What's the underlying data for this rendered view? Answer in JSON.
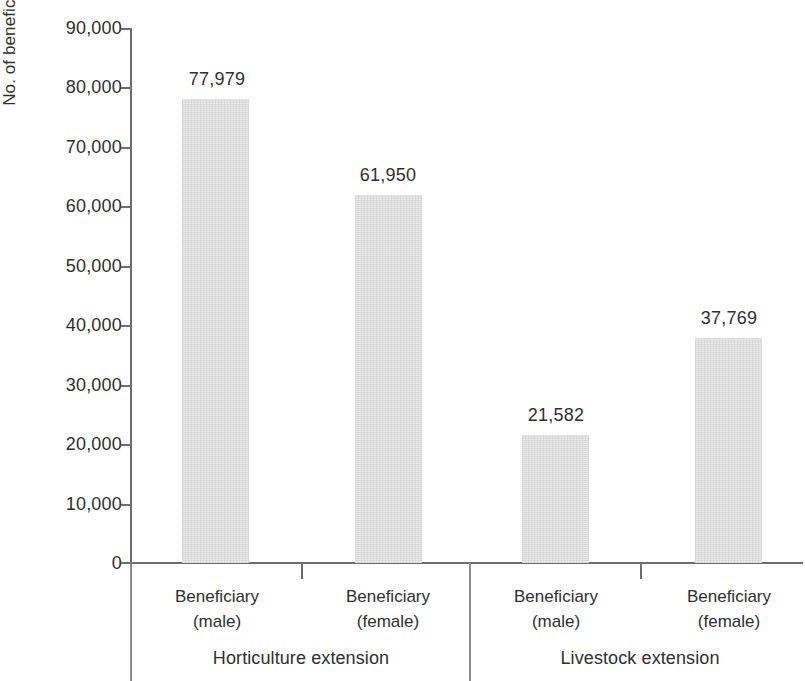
{
  "chart_data": {
    "type": "bar",
    "title": "",
    "subtitle": "",
    "xlabel": "",
    "ylabel": "No. of beneficiaries",
    "ylim": [
      0,
      90000
    ],
    "ytick_values": [
      0,
      10000,
      20000,
      30000,
      40000,
      50000,
      60000,
      70000,
      80000,
      90000
    ],
    "ytick_labels": [
      "0",
      "10,000",
      "20,000",
      "30,000",
      "40,000",
      "50,000",
      "60,000",
      "70,000",
      "80,000",
      "90,000"
    ],
    "grid": false,
    "legend": "none",
    "bar_color": "#ebebeb",
    "axis_color": "#6d6d6d",
    "text_color": "#2f2f2f",
    "categories": [
      "Beneficiary (male)",
      "Beneficiary (female)",
      "Beneficiary (male)",
      "Beneficiary (female)"
    ],
    "values": [
      77979,
      61950,
      21582,
      37769
    ],
    "value_labels": [
      "77,979",
      "61,950",
      "21,582",
      "37,769"
    ],
    "groups": [
      {
        "label": "Horticulture extension",
        "category_indices": [
          0,
          1
        ]
      },
      {
        "label": "Livestock extension",
        "category_indices": [
          2,
          3
        ]
      }
    ]
  },
  "axis": {
    "y_title": "No. of beneficiaries"
  },
  "bars": [
    {
      "line1": "Beneficiary",
      "line2": "(male)",
      "value_label": "77,979"
    },
    {
      "line1": "Beneficiary",
      "line2": "(female)",
      "value_label": "61,950"
    },
    {
      "line1": "Beneficiary",
      "line2": "(male)",
      "value_label": "21,582"
    },
    {
      "line1": "Beneficiary",
      "line2": "(female)",
      "value_label": "37,769"
    }
  ],
  "groups": [
    {
      "label": "Horticulture extension"
    },
    {
      "label": "Livestock extension"
    }
  ],
  "yticks": [
    {
      "label": "90,000"
    },
    {
      "label": "80,000"
    },
    {
      "label": "70,000"
    },
    {
      "label": "60,000"
    },
    {
      "label": "50,000"
    },
    {
      "label": "40,000"
    },
    {
      "label": "30,000"
    },
    {
      "label": "20,000"
    },
    {
      "label": "10,000"
    },
    {
      "label": "0"
    }
  ]
}
